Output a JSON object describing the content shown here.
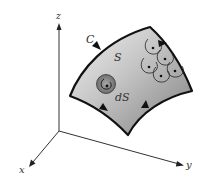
{
  "diagram": {
    "title": "",
    "axes": {
      "x_label": "x",
      "y_label": "y",
      "z_label": "z"
    },
    "labels": {
      "curve": "C",
      "surface": "S",
      "element": "dS"
    },
    "colors": {
      "axis": "#333333",
      "boundary": "#111111",
      "surface_light": "#e6e6e6",
      "surface_dark": "#8a8a8a",
      "element_fill": "#777777",
      "element_inner": "#999999",
      "loop": "#222222"
    }
  }
}
